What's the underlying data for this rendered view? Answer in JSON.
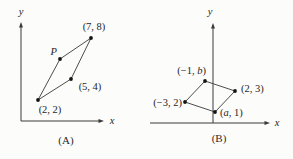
{
  "figure": {
    "background": "#fcfcfa",
    "ink": "#262626",
    "line_color": "#3a3a3a",
    "dot_color": "#141414"
  },
  "panels": [
    {
      "id": "A",
      "caption": "(A)",
      "axes": {
        "x_label": "x",
        "y_label": "y",
        "origin": {
          "x": 21,
          "y": 121
        },
        "x_end": 104,
        "y_end": 22,
        "x_label_pos": {
          "x": 112,
          "y": 124
        },
        "y_label_pos": {
          "x": 21,
          "y": 15
        }
      },
      "points": [
        {
          "px": 38,
          "py": 100,
          "lx": 50,
          "ly": 113,
          "anchor": "middle",
          "label": [
            {
              "t": "(2, 2)",
              "i": false
            }
          ]
        },
        {
          "px": 60,
          "py": 59,
          "lx": 57,
          "ly": 55,
          "anchor": "end",
          "label": [
            {
              "t": "P",
              "i": true
            }
          ]
        },
        {
          "px": 91,
          "py": 38,
          "lx": 94,
          "ly": 30,
          "anchor": "middle",
          "label": [
            {
              "t": "(7, 8)",
              "i": false
            }
          ]
        },
        {
          "px": 71,
          "py": 79,
          "lx": 90,
          "ly": 90,
          "anchor": "middle",
          "label": [
            {
              "t": "(5, 4)",
              "i": false
            }
          ]
        }
      ],
      "edges": [
        [
          0,
          1
        ],
        [
          1,
          2
        ],
        [
          2,
          3
        ],
        [
          3,
          0
        ]
      ]
    },
    {
      "id": "B",
      "caption": "(B)",
      "axes": {
        "x_label": "x",
        "y_label": "y",
        "origin": {
          "x": 213,
          "y": 123
        },
        "x_start": 150,
        "x_end": 270,
        "y_end": 23,
        "x_label_pos": {
          "x": 277,
          "y": 126
        },
        "y_label_pos": {
          "x": 210,
          "y": 15
        }
      },
      "points": [
        {
          "px": 185,
          "py": 102,
          "lx": 182,
          "ly": 106,
          "anchor": "end",
          "label": [
            {
              "t": "(−3, 2)",
              "i": false
            }
          ]
        },
        {
          "px": 205,
          "py": 81,
          "lx": 206,
          "ly": 74,
          "anchor": "end",
          "label": [
            {
              "t": "(−1, ",
              "i": false
            },
            {
              "t": "b",
              "i": true
            },
            {
              "t": ")",
              "i": false
            }
          ]
        },
        {
          "px": 235,
          "py": 91,
          "lx": 241,
          "ly": 92,
          "anchor": "start",
          "label": [
            {
              "t": "(2, 3)",
              "i": false
            }
          ]
        },
        {
          "px": 215,
          "py": 112,
          "lx": 220,
          "ly": 116,
          "anchor": "start",
          "label": [
            {
              "t": "(",
              "i": false
            },
            {
              "t": "a",
              "i": true
            },
            {
              "t": ", 1)",
              "i": false
            }
          ]
        }
      ],
      "edges": [
        [
          0,
          1
        ],
        [
          1,
          2
        ],
        [
          2,
          3
        ],
        [
          3,
          0
        ]
      ]
    }
  ]
}
